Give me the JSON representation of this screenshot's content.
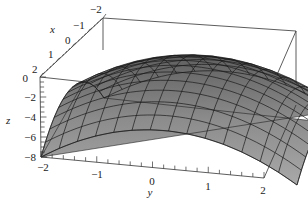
{
  "chart_data": {
    "type": "surface3d",
    "title": "",
    "function_hint": "z = -(x^2 + y^2)",
    "xlabel": "x",
    "ylabel": "y",
    "zlabel": "z",
    "x_ticks": [
      "-2",
      "-1",
      "0",
      "1",
      "2"
    ],
    "y_ticks": [
      "-2",
      "-1",
      "0",
      "1",
      "2"
    ],
    "z_ticks": [
      "0",
      "-2",
      "-4",
      "-6",
      "-8"
    ],
    "xlim": [
      -2,
      2
    ],
    "ylim": [
      -2,
      2
    ],
    "zlim": [
      -8,
      0
    ],
    "grid_divisions": 14,
    "surface_color": "#8a8a8a",
    "mesh_color": "#1a1a1a",
    "box": true
  },
  "labels": {
    "x": "x",
    "y": "y",
    "z": "z",
    "x_ticks": [
      "−2",
      "−1",
      "0",
      "1",
      "2"
    ],
    "y_ticks": [
      "−2",
      "−1",
      "0",
      "1",
      "2"
    ],
    "z_ticks": [
      "0",
      "−2",
      "−4",
      "−6",
      "−8"
    ]
  }
}
